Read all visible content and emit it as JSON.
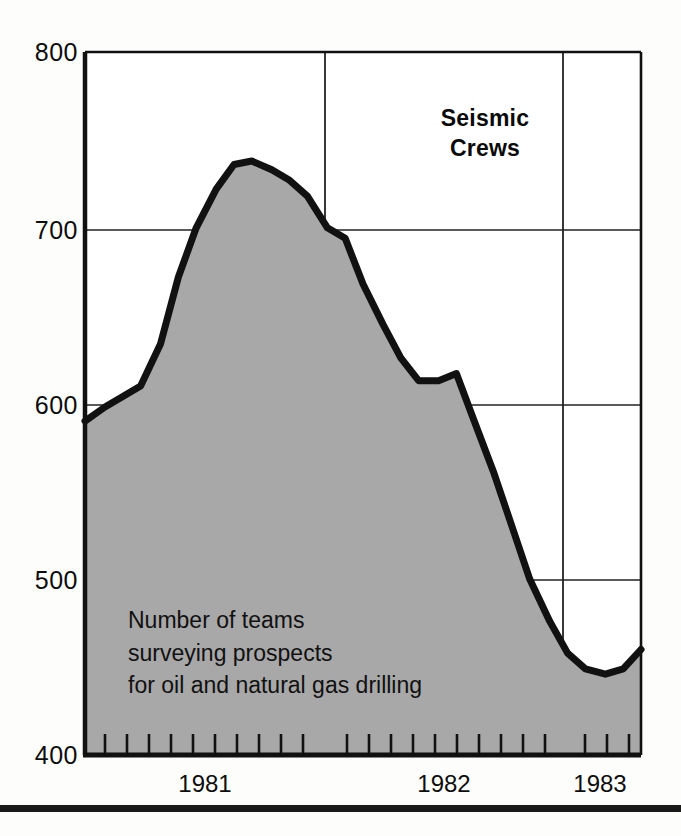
{
  "title": {
    "line1": "Seismic",
    "line2": "Crews"
  },
  "caption": {
    "line1": "Number of teams",
    "line2": "surveying prospects",
    "line3": "for oil and natural gas drilling"
  },
  "colors": {
    "area_fill": "#a8a8a8",
    "line": "#111111",
    "grid": "#222222",
    "text": "#111111"
  },
  "chart_data": {
    "type": "area",
    "title": "Seismic Crews",
    "subtitle": "Number of teams surveying prospects for oil and natural gas drilling",
    "xlabel": "",
    "ylabel": "",
    "ylim": [
      400,
      800
    ],
    "xlim": [
      1980.83,
      1983.33
    ],
    "ytick_labels": [
      "800",
      "700",
      "600",
      "500",
      "400"
    ],
    "yticks": [
      800,
      700,
      600,
      500,
      400
    ],
    "xtick_labels": [
      "1981",
      "1982",
      "1983"
    ],
    "xticks": [
      1981.5,
      1982.5,
      1983.17
    ],
    "year_boundaries": [
      1982.0,
      1983.0
    ],
    "grid": true,
    "legend": "none",
    "minor_tick_interval_months": 1,
    "series": [
      {
        "name": "Seismic crews",
        "x": [
          1980.83,
          1980.92,
          1981.0,
          1981.08,
          1981.17,
          1981.25,
          1981.33,
          1981.42,
          1981.5,
          1981.58,
          1981.67,
          1981.75,
          1981.83,
          1981.92,
          1982.0,
          1982.08,
          1982.17,
          1982.25,
          1982.33,
          1982.42,
          1982.5,
          1982.58,
          1982.67,
          1982.75,
          1982.83,
          1982.92,
          1983.0,
          1983.08,
          1983.17,
          1983.25,
          1983.33
        ],
        "values": [
          590,
          598,
          604,
          610,
          634,
          672,
          700,
          722,
          736,
          738,
          733,
          727,
          718,
          700,
          694,
          668,
          645,
          626,
          613,
          613,
          617,
          590,
          560,
          530,
          500,
          476,
          458,
          449,
          446,
          449,
          460
        ]
      }
    ],
    "annotations": [
      {
        "text": "Seismic Crews",
        "x": 1982.35,
        "y": 770
      },
      {
        "text": "Number of teams surveying prospects for oil and natural gas drilling",
        "x": 1981.05,
        "y": 488
      }
    ]
  }
}
